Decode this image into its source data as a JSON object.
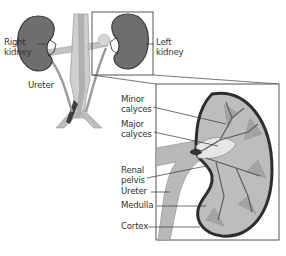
{
  "diagram": {
    "overview_labels": {
      "right_kidney": [
        "Right",
        "kidney"
      ],
      "left_kidney": [
        "Left",
        "kidney"
      ],
      "ureter": "Ureter"
    },
    "detail_labels": {
      "minor_calyces": [
        "Minor",
        "calyces"
      ],
      "major_calyces": [
        "Major",
        "calyces"
      ],
      "renal_pelvis": [
        "Renal",
        "pelvis"
      ],
      "ureter": "Ureter",
      "medulla": "Medulla",
      "cortex": "Cortex"
    },
    "colors": {
      "kidney_fill": "#6e6e6e",
      "kidney_outline": "#3a3a3a",
      "vessel_light": "#c8c8c8",
      "vessel_mid": "#9a9a9a",
      "vessel_dark": "#4a4a4a",
      "inset_fill": "#b9b9b9",
      "box_stroke": "#555555",
      "label_text": "#333333"
    }
  }
}
